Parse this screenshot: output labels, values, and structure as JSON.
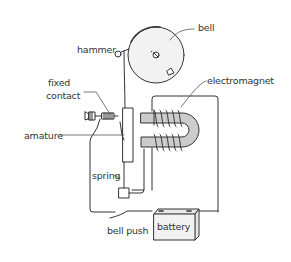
{
  "diagram": {
    "labels": {
      "bell": "bell",
      "hammer": "hammer",
      "fixed_contact_line1": "fixed",
      "fixed_contact_line2": "contact",
      "electromagnet": "electromagnet",
      "armature": "amature",
      "spring": "spring",
      "bell_push": "bell push",
      "battery": "battery"
    },
    "colors": {
      "line": "#333333",
      "fill_gray": "#cccccc",
      "bell_fill": "#f2f2f2",
      "background": "#ffffff"
    }
  }
}
